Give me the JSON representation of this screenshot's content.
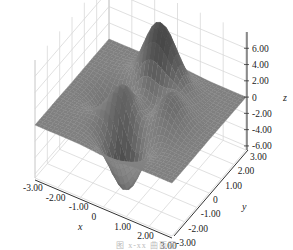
{
  "chart_data": {
    "type": "surface3d",
    "title": "",
    "function": "peaks: z = 3(1-x)^2 e^{-x^2-(y+1)^2} - 10(x/5 - x^3 - y^5) e^{-x^2-y^2} - 1/3 e^{-(x+1)^2-y^2}",
    "xlabel": "x",
    "ylabel": "y",
    "zlabel": "z",
    "xlim": [
      -3,
      3
    ],
    "ylim": [
      -3,
      3
    ],
    "zlim": [
      -6.5,
      8
    ],
    "x_ticks": [
      "-3.00",
      "-2.00",
      "-1.00",
      "0",
      "1.00",
      "2.00",
      "3.00"
    ],
    "y_ticks": [
      "-3.00",
      "-2.00",
      "-1.00",
      "0",
      "1.00",
      "2.00",
      "3.00"
    ],
    "z_ticks": [
      "-6.00",
      "-4.00",
      "-2.00",
      "0",
      "2.00",
      "4.00",
      "6.00"
    ],
    "z_tick_values": [
      -6,
      -4,
      -2,
      0,
      2,
      4,
      6
    ],
    "grid": true,
    "colormap": "grayscale",
    "peak_max_approx": 8.1,
    "peak_min_approx": -6.5,
    "legend": null
  },
  "caption": "图 x-xx 曲面图"
}
